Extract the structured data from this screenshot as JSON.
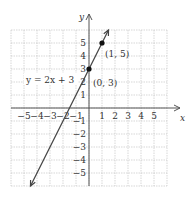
{
  "chart_data": {
    "type": "line",
    "title": "",
    "xlabel": "x",
    "ylabel": "y",
    "xlim": [
      -6,
      6
    ],
    "ylim": [
      -6,
      6
    ],
    "grid": true,
    "x_ticks": [
      "-5",
      "-4",
      "-3",
      "-2",
      "-1",
      "1",
      "2",
      "3",
      "4",
      "5"
    ],
    "y_ticks": [
      "5",
      "4",
      "3",
      "2",
      "1",
      "-1",
      "-2",
      "-3",
      "-4",
      "-5"
    ],
    "series": [
      {
        "name": "y = 2x + 3",
        "equation": "y = 2x + 3",
        "slope": 2,
        "intercept": 3,
        "x": [
          -4.5,
          1.5
        ],
        "y": [
          -6,
          6
        ]
      }
    ],
    "points": [
      {
        "x": 0,
        "y": 3,
        "label": "(0, 3)"
      },
      {
        "x": 1,
        "y": 5,
        "label": "(1, 5)"
      }
    ],
    "annotations": [
      "y = 2x + 3",
      "(0, 3)",
      "(1, 5)"
    ]
  },
  "labels": {
    "equation": "y = 2x + 3",
    "p1": "(0, 3)",
    "p2": "(1, 5)",
    "x_axis": "x",
    "y_axis": "y"
  },
  "colors": {
    "grid": "#bdbdbd",
    "axis": "#555555",
    "line": "#444444",
    "point": "#111111"
  }
}
